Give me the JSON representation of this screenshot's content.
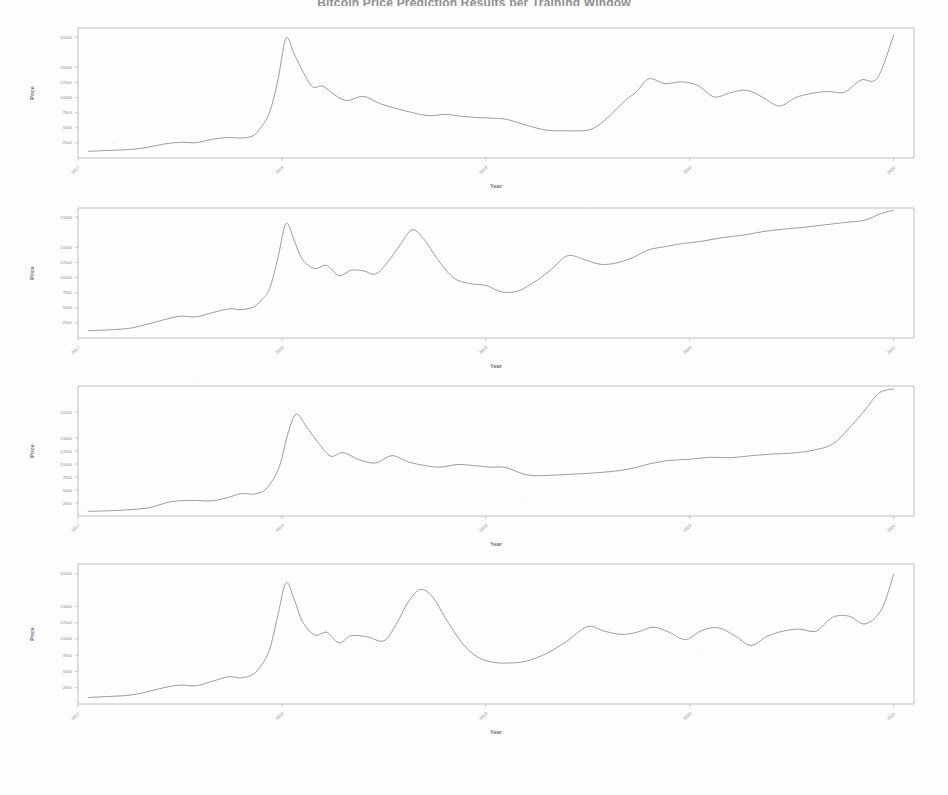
{
  "page": {
    "title": "Bitcoin Price Prediction Results per Training Window",
    "background_color": "#fdfdfd",
    "line_color": "#7c7c84",
    "axis_color": "#9a9aa0"
  },
  "axis_labels": {
    "x": "Year",
    "y": "Price"
  },
  "chart_data": [
    {
      "type": "line",
      "title": "",
      "xlabel": "Year",
      "ylabel": "Price",
      "xlim": [
        2017.0,
        2021.1
      ],
      "ylim": [
        0,
        21500
      ],
      "xticks": [
        2017,
        2018,
        2019,
        2020,
        2021
      ],
      "xticklabels": [
        "2017",
        "2018",
        "2019",
        "2020",
        "2021"
      ],
      "yticks": [
        2500,
        5000,
        7500,
        10000,
        12500,
        15000,
        20000
      ],
      "yticklabels": [
        "2500",
        "5000",
        "7500",
        "10000",
        "12500",
        "15000",
        "20000"
      ],
      "grid": false,
      "legend": "none",
      "series": [
        {
          "name": "Price",
          "x": [
            2017.05,
            2017.15,
            2017.25,
            2017.33,
            2017.42,
            2017.5,
            2017.58,
            2017.66,
            2017.74,
            2017.8,
            2017.86,
            2017.9,
            2017.94,
            2017.98,
            2018.02,
            2018.06,
            2018.1,
            2018.15,
            2018.2,
            2018.26,
            2018.32,
            2018.4,
            2018.48,
            2018.56,
            2018.64,
            2018.72,
            2018.8,
            2018.88,
            2018.95,
            2019.02,
            2019.1,
            2019.2,
            2019.3,
            2019.4,
            2019.5,
            2019.56,
            2019.62,
            2019.68,
            2019.74,
            2019.8,
            2019.88,
            2019.96,
            2020.04,
            2020.12,
            2020.2,
            2020.28,
            2020.36,
            2020.44,
            2020.52,
            2020.6,
            2020.68,
            2020.76,
            2020.84,
            2020.92,
            2021.0
          ],
          "y": [
            1100,
            1250,
            1400,
            1700,
            2300,
            2600,
            2550,
            3100,
            3400,
            3300,
            3700,
            5200,
            7600,
            12800,
            19800,
            17200,
            14500,
            11800,
            11900,
            10400,
            9500,
            10200,
            9000,
            8200,
            7500,
            7000,
            7200,
            6900,
            6700,
            6600,
            6400,
            5400,
            4600,
            4500,
            4600,
            5600,
            7400,
            9400,
            11000,
            13100,
            12300,
            12600,
            12000,
            10100,
            10800,
            11200,
            10000,
            8600,
            10000,
            10700,
            11000,
            10900,
            12900,
            13200,
            20300
          ]
        }
      ]
    },
    {
      "type": "line",
      "title": "",
      "xlabel": "Year",
      "ylabel": "Price",
      "xlim": [
        2017.0,
        2021.1
      ],
      "ylim": [
        0,
        21500
      ],
      "xticks": [
        2017,
        2018,
        2019,
        2020,
        2021
      ],
      "xticklabels": [
        "2017",
        "2018",
        "2019",
        "2020",
        "2021"
      ],
      "yticks": [
        2500,
        5000,
        7500,
        10000,
        12500,
        15000,
        20000
      ],
      "yticklabels": [
        "2500",
        "5000",
        "7500",
        "10000",
        "12500",
        "15000",
        "20000"
      ],
      "grid": false,
      "legend": "none",
      "series": [
        {
          "name": "Price",
          "x": [
            2017.05,
            2017.15,
            2017.25,
            2017.33,
            2017.42,
            2017.5,
            2017.58,
            2017.66,
            2017.74,
            2017.8,
            2017.86,
            2017.9,
            2017.94,
            2017.98,
            2018.02,
            2018.06,
            2018.1,
            2018.16,
            2018.22,
            2018.28,
            2018.34,
            2018.4,
            2018.46,
            2018.52,
            2018.58,
            2018.64,
            2018.7,
            2018.76,
            2018.84,
            2018.92,
            2019.0,
            2019.08,
            2019.16,
            2019.24,
            2019.32,
            2019.4,
            2019.48,
            2019.56,
            2019.64,
            2019.72,
            2019.8,
            2019.88,
            2019.96,
            2020.06,
            2020.16,
            2020.26,
            2020.36,
            2020.46,
            2020.56,
            2020.66,
            2020.76,
            2020.86,
            2020.94,
            2021.0
          ],
          "y": [
            1200,
            1350,
            1600,
            2200,
            3000,
            3600,
            3500,
            4200,
            4800,
            4700,
            5100,
            6300,
            8200,
            13200,
            18900,
            16200,
            13000,
            11500,
            12000,
            10300,
            11200,
            11100,
            10600,
            12600,
            15400,
            17900,
            16200,
            13200,
            10000,
            9000,
            8700,
            7600,
            7800,
            9300,
            11300,
            13600,
            13000,
            12200,
            12400,
            13300,
            14600,
            15100,
            15600,
            16000,
            16600,
            17000,
            17600,
            18000,
            18300,
            18700,
            19100,
            19500,
            20600,
            21100
          ]
        }
      ]
    },
    {
      "type": "line",
      "title": "",
      "xlabel": "Year",
      "ylabel": "Price",
      "xlim": [
        2017.0,
        2021.1
      ],
      "ylim": [
        0,
        25000
      ],
      "xticks": [
        2017,
        2018,
        2019,
        2020,
        2021
      ],
      "xticklabels": [
        "2017",
        "2018",
        "2019",
        "2020",
        "2021"
      ],
      "yticks": [
        2500,
        5000,
        7500,
        10000,
        12500,
        15000,
        20000
      ],
      "yticklabels": [
        "2500",
        "5000",
        "7500",
        "10000",
        "12500",
        "15000",
        "20000"
      ],
      "grid": false,
      "legend": "none",
      "series": [
        {
          "name": "Price",
          "x": [
            2017.05,
            2017.15,
            2017.25,
            2017.35,
            2017.45,
            2017.55,
            2017.65,
            2017.73,
            2017.8,
            2017.86,
            2017.91,
            2017.95,
            2017.99,
            2018.03,
            2018.07,
            2018.12,
            2018.18,
            2018.24,
            2018.3,
            2018.38,
            2018.46,
            2018.54,
            2018.62,
            2018.7,
            2018.78,
            2018.86,
            2018.94,
            2019.02,
            2019.1,
            2019.2,
            2019.3,
            2019.4,
            2019.5,
            2019.6,
            2019.7,
            2019.8,
            2019.9,
            2020.0,
            2020.1,
            2020.2,
            2020.3,
            2020.4,
            2020.5,
            2020.6,
            2020.7,
            2020.78,
            2020.86,
            2020.92,
            2020.97,
            2021.0
          ],
          "y": [
            900,
            1000,
            1200,
            1600,
            2700,
            3000,
            2900,
            3500,
            4300,
            4200,
            4800,
            6600,
            9800,
            15900,
            19600,
            17200,
            14000,
            11500,
            12200,
            10800,
            10200,
            11600,
            10400,
            9700,
            9400,
            9900,
            9700,
            9400,
            9300,
            7900,
            7800,
            8000,
            8200,
            8500,
            9000,
            10000,
            10700,
            10900,
            11300,
            11200,
            11600,
            11900,
            12100,
            12600,
            13800,
            16800,
            20400,
            23400,
            24300,
            24400
          ]
        }
      ]
    },
    {
      "type": "line",
      "title": "",
      "xlabel": "Year",
      "ylabel": "Price",
      "xlim": [
        2017.0,
        2021.1
      ],
      "ylim": [
        0,
        21500
      ],
      "xticks": [
        2017,
        2018,
        2019,
        2020,
        2021
      ],
      "xticklabels": [
        "2017",
        "2018",
        "2019",
        "2020",
        "2021"
      ],
      "yticks": [
        2500,
        5000,
        7500,
        10000,
        12500,
        15000,
        20000
      ],
      "yticklabels": [
        "2500",
        "5000",
        "7500",
        "10000",
        "12500",
        "15000",
        "20000"
      ],
      "grid": false,
      "legend": "none",
      "series": [
        {
          "name": "Price",
          "x": [
            2017.05,
            2017.15,
            2017.25,
            2017.33,
            2017.42,
            2017.5,
            2017.58,
            2017.66,
            2017.74,
            2017.8,
            2017.86,
            2017.9,
            2017.94,
            2017.98,
            2018.02,
            2018.06,
            2018.1,
            2018.16,
            2018.22,
            2018.28,
            2018.34,
            2018.42,
            2018.5,
            2018.56,
            2018.62,
            2018.68,
            2018.74,
            2018.8,
            2018.88,
            2018.96,
            2019.04,
            2019.12,
            2019.2,
            2019.3,
            2019.4,
            2019.5,
            2019.58,
            2019.66,
            2019.74,
            2019.82,
            2019.9,
            2019.98,
            2020.06,
            2020.14,
            2020.22,
            2020.3,
            2020.38,
            2020.46,
            2020.54,
            2020.62,
            2020.7,
            2020.78,
            2020.86,
            2020.94,
            2021.0
          ],
          "y": [
            1000,
            1150,
            1350,
            1800,
            2500,
            2900,
            2800,
            3500,
            4200,
            4000,
            4600,
            6000,
            8400,
            13600,
            18600,
            16100,
            12700,
            10600,
            11000,
            9400,
            10500,
            10300,
            9700,
            12200,
            15700,
            17600,
            16400,
            13300,
            9500,
            7200,
            6400,
            6300,
            6600,
            7800,
            9700,
            11900,
            11200,
            10700,
            11000,
            11800,
            11000,
            9900,
            11300,
            11700,
            10500,
            9000,
            10400,
            11200,
            11500,
            11200,
            13300,
            13500,
            12300,
            14500,
            19900
          ]
        }
      ]
    }
  ]
}
